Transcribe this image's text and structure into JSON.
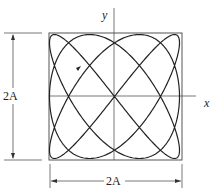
{
  "figure": {
    "type": "lissajous",
    "x_axis_label": "x",
    "y_axis_label": "y",
    "width_dimension": "2A",
    "height_dimension": "2A",
    "frequency_ratio_x_to_y": "2:3",
    "direction_arrow": "up-left"
  }
}
